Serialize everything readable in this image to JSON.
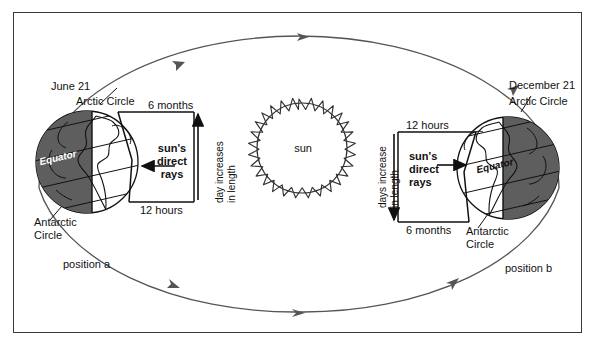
{
  "diagram": {
    "type": "astronomy-orbit-diagram",
    "colors": {
      "ink": "#111111",
      "frame": "#3a3a3a",
      "orbit": "#555555",
      "globe_dark": "#5e5e5e",
      "globe_light": "#ffffff"
    }
  },
  "sun": {
    "label": "sun"
  },
  "position_a": {
    "date_label": "June 21",
    "arctic_label": "Arctic Circle",
    "antarctic_label_line1": "Antarctic",
    "antarctic_label_line2": "Circle",
    "equator_label": "Equator",
    "position_label": "position a",
    "box": {
      "top_label": "6 months",
      "bottom_label": "12 hours",
      "rays_line1": "sun's",
      "rays_line2": "direct",
      "rays_line3": "rays",
      "vertical_line1": "day increases",
      "vertical_line2": "in length",
      "ray_arrow_direction": "left",
      "vertical_arrow_direction": "up"
    },
    "shaded_side": "left",
    "north_pole_tilt": "toward sun"
  },
  "position_b": {
    "date_label": "December 21",
    "arctic_label": "Arctic Circle",
    "antarctic_label_line1": "Antarctic",
    "antarctic_label_line2": "Circle",
    "equator_label": "Equator",
    "position_label": "position b",
    "box": {
      "top_label": "12 hours",
      "bottom_label": "6 months",
      "rays_line1": "sun's",
      "rays_line2": "direct",
      "rays_line3": "rays",
      "vertical_line1": "days increase",
      "vertical_line2": "in length",
      "ray_arrow_direction": "right",
      "vertical_arrow_direction": "down"
    },
    "shaded_side": "right",
    "north_pole_tilt": "away from sun"
  },
  "orbit": {
    "shape": "ellipse",
    "direction": "counterclockwise",
    "arrow_count_top": 3,
    "arrow_count_bottom": 3
  }
}
